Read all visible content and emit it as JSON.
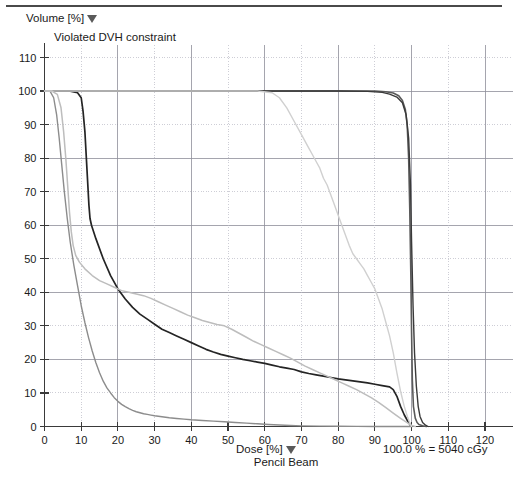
{
  "window": {
    "title": "DVH - Dose Volume Histogram"
  },
  "labels": {
    "y_axis_title": "Volume [%]",
    "x_axis_title": "Dose [%]",
    "plan_name": "Pencil Beam",
    "normalization": "100.0 % = 5040 cGy",
    "constraint_warning": "Violated DVH constraint",
    "dropdown_icon": "triangle-down-icon"
  },
  "colors": {
    "background": "#ffffff",
    "axis": "#3a3a3a",
    "grid_major": "#8e8e9a",
    "grid_minor": "#b9b9c4",
    "text": "#1a1a1a",
    "curve_target": "#5a5a5a",
    "curve_black": "#242424",
    "curve_mid": "#8c8c8c",
    "curve_light": "#bdbdbd",
    "curve_lighter": "#d0d0d0"
  },
  "chart_data": {
    "type": "line",
    "title": "Violated DVH constraint",
    "xlabel": "Dose [%]",
    "ylabel": "Volume [%]",
    "xlim": [
      0,
      125
    ],
    "ylim": [
      0,
      113
    ],
    "grid": true,
    "legend_position": "none",
    "xticks": [
      0,
      10,
      20,
      30,
      40,
      50,
      60,
      70,
      80,
      90,
      100,
      110,
      120
    ],
    "yticks": [
      0,
      10,
      20,
      30,
      40,
      50,
      60,
      70,
      80,
      90,
      100,
      110
    ],
    "ytick_labels": [
      "0",
      "10",
      "20",
      "30",
      "40",
      "50",
      "60",
      "70",
      "80",
      "90",
      "100",
      "110"
    ],
    "series": [
      {
        "name": "PTV / Target",
        "color": "#5a5a5a",
        "width": 1.6,
        "points": [
          [
            0,
            100
          ],
          [
            20,
            100
          ],
          [
            40,
            100
          ],
          [
            60,
            100
          ],
          [
            75,
            100
          ],
          [
            85,
            100
          ],
          [
            90,
            100
          ],
          [
            93,
            99.8
          ],
          [
            95,
            99.4
          ],
          [
            96.5,
            98.6
          ],
          [
            97.5,
            97.2
          ],
          [
            98.3,
            94.5
          ],
          [
            98.8,
            90
          ],
          [
            99.2,
            80
          ],
          [
            99.5,
            65
          ],
          [
            99.8,
            45
          ],
          [
            100,
            28
          ],
          [
            100.2,
            14
          ],
          [
            100.5,
            6
          ],
          [
            101,
            2.5
          ],
          [
            101.5,
            1.2
          ],
          [
            102,
            0.6
          ],
          [
            103,
            0.2
          ],
          [
            104,
            0
          ]
        ]
      },
      {
        "name": "PTV boost",
        "color": "#3a3a3a",
        "width": 1.4,
        "points": [
          [
            0,
            100
          ],
          [
            30,
            100
          ],
          [
            55,
            100
          ],
          [
            70,
            100
          ],
          [
            80,
            100
          ],
          [
            88,
            99.9
          ],
          [
            92,
            99.6
          ],
          [
            94,
            99.1
          ],
          [
            96,
            98.2
          ],
          [
            97.5,
            96.5
          ],
          [
            98.5,
            93
          ],
          [
            99.2,
            86
          ],
          [
            99.7,
            72
          ],
          [
            100,
            55
          ],
          [
            100.4,
            36
          ],
          [
            100.8,
            22
          ],
          [
            101.3,
            12
          ],
          [
            101.8,
            6
          ],
          [
            102.3,
            3
          ],
          [
            103,
            1.2
          ],
          [
            103.8,
            0.4
          ],
          [
            104.5,
            0
          ]
        ]
      },
      {
        "name": "Rectum",
        "color": "#242424",
        "width": 1.7,
        "points": [
          [
            0,
            100
          ],
          [
            4,
            100
          ],
          [
            7,
            100
          ],
          [
            9,
            99.5
          ],
          [
            10,
            98
          ],
          [
            10.5,
            94
          ],
          [
            11,
            88
          ],
          [
            11.4,
            80
          ],
          [
            11.8,
            72
          ],
          [
            12.1,
            66
          ],
          [
            12.4,
            62
          ],
          [
            12.8,
            60
          ],
          [
            14,
            56
          ],
          [
            16,
            50
          ],
          [
            18,
            45
          ],
          [
            20,
            41
          ],
          [
            22,
            38
          ],
          [
            24,
            35.5
          ],
          [
            26,
            33.5
          ],
          [
            28,
            32
          ],
          [
            30,
            30.5
          ],
          [
            32,
            29
          ],
          [
            34,
            28
          ],
          [
            36,
            27
          ],
          [
            38,
            26
          ],
          [
            40,
            25
          ],
          [
            42,
            24
          ],
          [
            44,
            23
          ],
          [
            46,
            22.2
          ],
          [
            48,
            21.5
          ],
          [
            50,
            21
          ],
          [
            52,
            20.5
          ],
          [
            54,
            20
          ],
          [
            56,
            19.6
          ],
          [
            58,
            19.2
          ],
          [
            60,
            18.8
          ],
          [
            62,
            18.3
          ],
          [
            64,
            17.8
          ],
          [
            66,
            17.4
          ],
          [
            68,
            17
          ],
          [
            70,
            16.3
          ],
          [
            72,
            15.8
          ],
          [
            74,
            15.4
          ],
          [
            76,
            15
          ],
          [
            78,
            14.6
          ],
          [
            80,
            14.2
          ],
          [
            82,
            13.9
          ],
          [
            84,
            13.6
          ],
          [
            86,
            13.3
          ],
          [
            88,
            13
          ],
          [
            90,
            12.6
          ],
          [
            92,
            12.2
          ],
          [
            94,
            11.8
          ],
          [
            95,
            11
          ],
          [
            96,
            9
          ],
          [
            97,
            6
          ],
          [
            98,
            3.5
          ],
          [
            99,
            1.5
          ],
          [
            99.6,
            0.5
          ],
          [
            100,
            0
          ]
        ]
      },
      {
        "name": "Bladder",
        "color": "#bdbdbd",
        "width": 1.5,
        "points": [
          [
            0,
            100
          ],
          [
            2,
            100
          ],
          [
            3.5,
            99
          ],
          [
            4.5,
            95
          ],
          [
            5.2,
            88
          ],
          [
            5.8,
            80
          ],
          [
            6.3,
            72
          ],
          [
            6.8,
            64
          ],
          [
            7.3,
            58
          ],
          [
            7.8,
            54
          ],
          [
            8.5,
            51
          ],
          [
            9.5,
            49
          ],
          [
            11,
            47
          ],
          [
            13,
            45
          ],
          [
            15,
            43.5
          ],
          [
            17,
            42.5
          ],
          [
            19,
            41.5
          ],
          [
            21,
            40.5
          ],
          [
            23,
            40
          ],
          [
            25,
            39.5
          ],
          [
            27,
            39
          ],
          [
            29,
            38.2
          ],
          [
            31,
            37.2
          ],
          [
            33,
            36.2
          ],
          [
            35,
            35.2
          ],
          [
            37,
            34.2
          ],
          [
            39,
            33.2
          ],
          [
            41,
            32.4
          ],
          [
            43,
            31.6
          ],
          [
            45,
            31
          ],
          [
            47,
            30.4
          ],
          [
            49,
            30
          ],
          [
            51,
            29
          ],
          [
            53,
            27.8
          ],
          [
            55,
            26.6
          ],
          [
            57,
            25.4
          ],
          [
            59,
            24.4
          ],
          [
            61,
            23.4
          ],
          [
            63,
            22.4
          ],
          [
            65,
            21.4
          ],
          [
            67,
            20.4
          ],
          [
            69,
            19.2
          ],
          [
            71,
            18
          ],
          [
            73,
            17
          ],
          [
            75,
            16
          ],
          [
            77,
            15
          ],
          [
            79,
            14
          ],
          [
            81,
            13
          ],
          [
            83,
            12
          ],
          [
            85,
            11
          ],
          [
            87,
            9.8
          ],
          [
            89,
            8.6
          ],
          [
            91,
            7.2
          ],
          [
            93,
            5.6
          ],
          [
            95,
            4
          ],
          [
            97,
            2.4
          ],
          [
            99,
            1
          ],
          [
            100,
            0.3
          ],
          [
            101,
            0
          ]
        ]
      },
      {
        "name": "Body / External",
        "color": "#8c8c8c",
        "width": 1.4,
        "points": [
          [
            0,
            100
          ],
          [
            1.5,
            100
          ],
          [
            2.5,
            98
          ],
          [
            3.3,
            93
          ],
          [
            4,
            86
          ],
          [
            4.7,
            78
          ],
          [
            5.4,
            70
          ],
          [
            6.2,
            62
          ],
          [
            7,
            55
          ],
          [
            8,
            48
          ],
          [
            9,
            42
          ],
          [
            10,
            36
          ],
          [
            11,
            31
          ],
          [
            12,
            26.5
          ],
          [
            13,
            22.5
          ],
          [
            14,
            19
          ],
          [
            15,
            16
          ],
          [
            16,
            13.5
          ],
          [
            17,
            11.5
          ],
          [
            18,
            10
          ],
          [
            19,
            8.6
          ],
          [
            20,
            7.5
          ],
          [
            21,
            6.6
          ],
          [
            22,
            5.9
          ],
          [
            23,
            5.3
          ],
          [
            24,
            4.8
          ],
          [
            25,
            4.4
          ],
          [
            26,
            4.1
          ],
          [
            27,
            3.8
          ],
          [
            28,
            3.6
          ],
          [
            29,
            3.4
          ],
          [
            30,
            3.2
          ],
          [
            32,
            2.9
          ],
          [
            34,
            2.6
          ],
          [
            36,
            2.4
          ],
          [
            38,
            2.2
          ],
          [
            40,
            2
          ],
          [
            43,
            1.8
          ],
          [
            46,
            1.6
          ],
          [
            49,
            1.4
          ],
          [
            52,
            1.2
          ],
          [
            55,
            1
          ],
          [
            58,
            0.8
          ],
          [
            61,
            0.6
          ],
          [
            64,
            0.45
          ],
          [
            67,
            0.3
          ],
          [
            70,
            0.2
          ],
          [
            75,
            0.12
          ],
          [
            80,
            0.06
          ],
          [
            85,
            0.03
          ],
          [
            90,
            0.01
          ],
          [
            95,
            0
          ],
          [
            100,
            0
          ]
        ]
      },
      {
        "name": "Femoral heads",
        "color": "#d0d0d0",
        "width": 1.4,
        "points": [
          [
            0,
            100
          ],
          [
            35,
            100
          ],
          [
            50,
            100
          ],
          [
            58,
            100
          ],
          [
            62,
            99.5
          ],
          [
            64,
            98
          ],
          [
            66,
            95
          ],
          [
            68,
            91
          ],
          [
            70,
            87
          ],
          [
            72,
            83
          ],
          [
            73,
            81
          ],
          [
            74,
            79
          ],
          [
            75,
            77
          ],
          [
            76,
            74
          ],
          [
            77,
            72
          ],
          [
            78,
            69
          ],
          [
            79,
            66
          ],
          [
            80,
            63
          ],
          [
            81,
            60
          ],
          [
            82,
            57
          ],
          [
            83,
            54
          ],
          [
            84,
            51.5
          ],
          [
            85,
            50
          ],
          [
            86,
            48.5
          ],
          [
            87,
            47
          ],
          [
            88,
            45
          ],
          [
            89,
            43
          ],
          [
            90,
            41
          ],
          [
            91,
            38
          ],
          [
            92,
            35
          ],
          [
            93,
            31
          ],
          [
            94,
            27
          ],
          [
            95,
            22
          ],
          [
            96,
            16
          ],
          [
            97,
            10.5
          ],
          [
            98,
            6
          ],
          [
            99,
            2.5
          ],
          [
            99.7,
            0.6
          ],
          [
            100,
            0
          ]
        ]
      }
    ]
  }
}
